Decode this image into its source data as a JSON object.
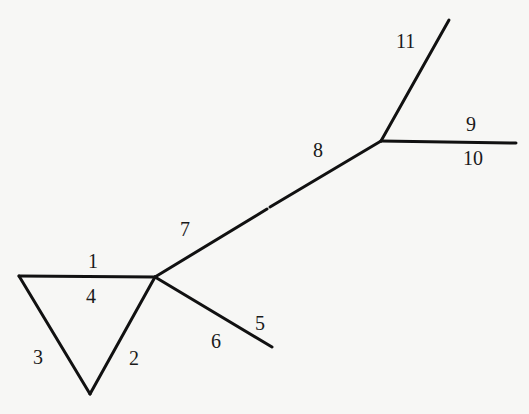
{
  "diagram": {
    "type": "graph",
    "colors": {
      "background": "#f7f7f5",
      "stroke": "#111111",
      "label": "#1a1a1a"
    },
    "vertices": [
      {
        "id": "A",
        "x": 19,
        "y": 276
      },
      {
        "id": "B",
        "x": 155,
        "y": 277
      },
      {
        "id": "C",
        "x": 90,
        "y": 394
      },
      {
        "id": "D",
        "x": 272,
        "y": 347
      },
      {
        "id": "E",
        "x": 381,
        "y": 141
      },
      {
        "id": "F",
        "x": 449,
        "y": 20
      },
      {
        "id": "G",
        "x": 516,
        "y": 143
      }
    ],
    "edges": [
      {
        "id": "e-top",
        "from": "A",
        "to": "B"
      },
      {
        "id": "e-right",
        "from": "B",
        "to": "C"
      },
      {
        "id": "e-left",
        "from": "A",
        "to": "C"
      },
      {
        "id": "e-lower",
        "from": "B",
        "to": "D"
      },
      {
        "id": "e-long-a",
        "x1": 155,
        "y1": 277,
        "x2": 267,
        "y2": 209
      },
      {
        "id": "e-long-b",
        "x1": 270,
        "y1": 207,
        "x2": 381,
        "y2": 141
      },
      {
        "id": "e-up",
        "from": "E",
        "to": "F"
      },
      {
        "id": "e-flat",
        "from": "E",
        "to": "G"
      }
    ],
    "labels": [
      {
        "text": "1",
        "x": 88,
        "y": 268
      },
      {
        "text": "4",
        "x": 86,
        "y": 303
      },
      {
        "text": "3",
        "x": 33,
        "y": 364
      },
      {
        "text": "2",
        "x": 129,
        "y": 365
      },
      {
        "text": "5",
        "x": 255,
        "y": 330
      },
      {
        "text": "6",
        "x": 211,
        "y": 348
      },
      {
        "text": "7",
        "x": 180,
        "y": 236
      },
      {
        "text": "8",
        "x": 313,
        "y": 157
      },
      {
        "text": "9",
        "x": 466,
        "y": 131
      },
      {
        "text": "10",
        "x": 463,
        "y": 165
      },
      {
        "text": "11",
        "x": 396,
        "y": 48
      }
    ]
  }
}
